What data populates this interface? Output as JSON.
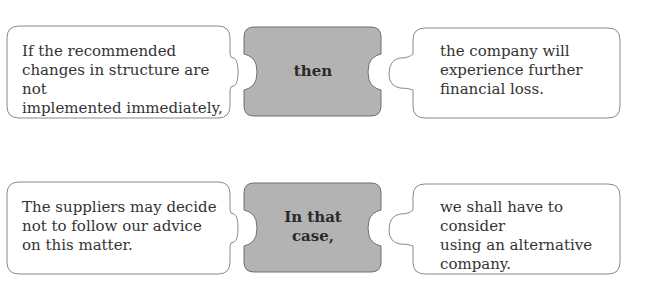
{
  "colors": {
    "connector_fill": "#b3b3b3",
    "connector_stroke": "#6e6e6e",
    "clause_fill": "#ffffff",
    "clause_stroke": "#8a8a8a",
    "text": "#333333"
  },
  "rows": [
    {
      "left_clause": [
        "If the recommended",
        "changes in structure are not",
        "implemented immediately,"
      ],
      "connector": [
        "then"
      ],
      "right_clause": [
        "the company will",
        "experience further",
        "financial loss."
      ]
    },
    {
      "left_clause": [
        "The suppliers may decide",
        "not to follow our advice",
        "on this matter."
      ],
      "connector": [
        "In that",
        "case,"
      ],
      "right_clause": [
        "we shall have to consider",
        "using an alternative",
        "company."
      ]
    }
  ]
}
